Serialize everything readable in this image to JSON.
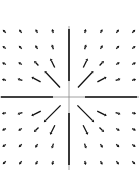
{
  "diagram": {
    "type": "vector-field",
    "colors": {
      "background": "#ffffff",
      "axis": "#888888",
      "arrow": "#111111"
    },
    "origin": [
      69,
      97
    ],
    "grid_x": [
      5,
      21,
      37,
      53,
      85,
      101,
      117,
      133
    ],
    "grid_y": [
      32,
      48,
      64,
      80,
      113,
      129,
      145,
      162
    ],
    "axes": {
      "x_range": [
        0,
        139
      ],
      "y_range": [
        26,
        170
      ]
    }
  }
}
